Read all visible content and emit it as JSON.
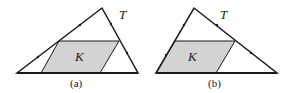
{
  "figure": {
    "panels": [
      {
        "caption": "(a)",
        "triangle_label": "T",
        "region_label": "K",
        "colors": {
          "stroke": "#1a1a1a",
          "fill": "#d3d3d3"
        }
      },
      {
        "caption": "(b)",
        "triangle_label": "T",
        "region_label": "K",
        "colors": {
          "stroke": "#1a1a1a",
          "fill": "#d3d3d3"
        }
      }
    ]
  }
}
